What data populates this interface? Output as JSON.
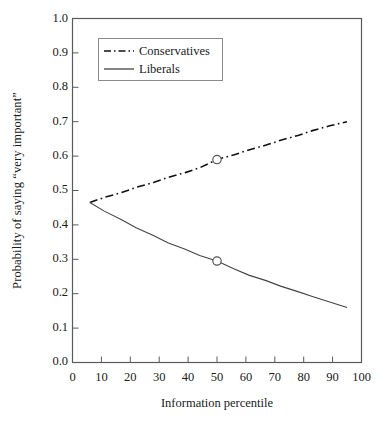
{
  "chart_data": {
    "type": "line",
    "title": "",
    "xlabel": "Information percentile",
    "ylabel": "Probability of saying “very important”",
    "xlim": [
      0,
      100
    ],
    "ylim": [
      0.0,
      1.0
    ],
    "xticks": [
      0,
      10,
      20,
      30,
      40,
      50,
      60,
      70,
      80,
      90,
      100
    ],
    "xtick_labels": [
      "0",
      "10",
      "20",
      "30",
      "40",
      "50",
      "60",
      "70",
      "80",
      "90",
      "100"
    ],
    "yticks": [
      0.0,
      0.1,
      0.2,
      0.3,
      0.4,
      0.5,
      0.6,
      0.7,
      0.8,
      0.9,
      1.0
    ],
    "ytick_labels": [
      "0.0",
      "0.1",
      "0.2",
      "0.3",
      "0.4",
      "0.5",
      "0.6",
      "0.7",
      "0.8",
      "0.9",
      "1.0"
    ],
    "grid": false,
    "legend_position": "upper left",
    "series": [
      {
        "name": "Conservatives",
        "style": "dash-dot",
        "color": "#111111",
        "x": [
          6,
          11,
          17,
          22,
          28,
          33,
          39,
          44,
          50,
          56,
          61,
          67,
          72,
          78,
          83,
          89,
          95
        ],
        "y": [
          0.465,
          0.48,
          0.494,
          0.509,
          0.523,
          0.538,
          0.552,
          0.566,
          0.59,
          0.604,
          0.618,
          0.632,
          0.646,
          0.66,
          0.674,
          0.688,
          0.7
        ],
        "marker_points": [
          {
            "x": 50,
            "y": 0.59
          }
        ]
      },
      {
        "name": "Liberals",
        "style": "solid",
        "color": "#444444",
        "x": [
          6,
          11,
          17,
          22,
          28,
          33,
          39,
          44,
          50,
          56,
          61,
          67,
          72,
          78,
          83,
          89,
          95
        ],
        "y": [
          0.465,
          0.44,
          0.415,
          0.392,
          0.369,
          0.348,
          0.329,
          0.311,
          0.295,
          0.272,
          0.254,
          0.238,
          0.222,
          0.206,
          0.192,
          0.176,
          0.16
        ],
        "marker_points": [
          {
            "x": 50,
            "y": 0.295
          }
        ]
      }
    ]
  },
  "legend": {
    "items": [
      {
        "label": "Conservatives",
        "style": "dash-dot"
      },
      {
        "label": "Liberals",
        "style": "solid"
      }
    ]
  },
  "axes": {
    "y_title": "Probability of saying “very important”",
    "x_title": "Information percentile"
  }
}
